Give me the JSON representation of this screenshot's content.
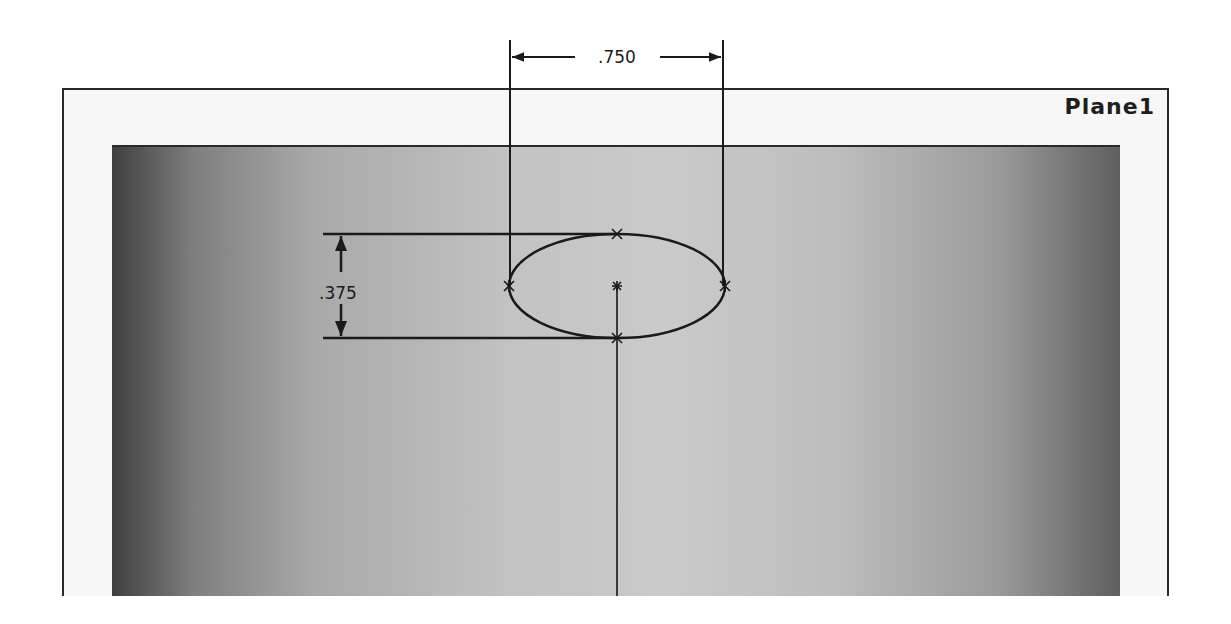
{
  "plane": {
    "label": "Plane1"
  },
  "dimensions": {
    "width": {
      "value": ".750",
      "orientation": "horizontal"
    },
    "height": {
      "value": ".375",
      "orientation": "vertical"
    }
  },
  "sketch": {
    "entity": "ellipse",
    "center": [
      617,
      286
    ],
    "major_radius_px": 108,
    "minor_radius_px": 52
  },
  "colors": {
    "line": "#1a1a1a",
    "frame": "#2a2a2a",
    "panel_edge_dark": "#3f3f3f",
    "panel_center": "#cacaca"
  }
}
